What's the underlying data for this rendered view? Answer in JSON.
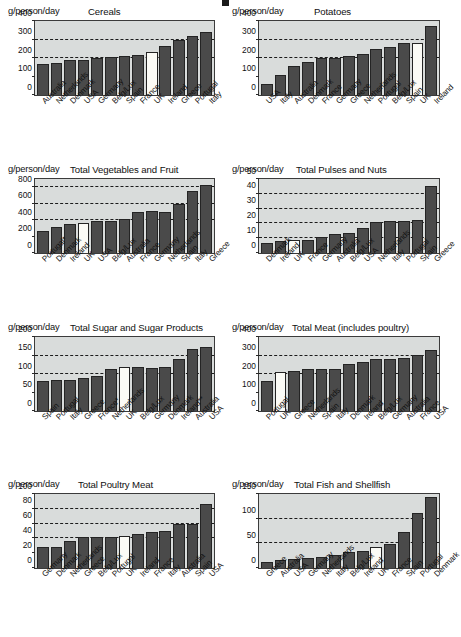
{
  "figure": {
    "yaxis_unit_label": "g/person/day",
    "highlight_country": "UK",
    "highlight_note": "UK bar drawn in white/unfilled"
  },
  "chart_data": [
    {
      "id": "cereals",
      "type": "bar",
      "title": "Cereals",
      "ylabel": "g/person/day",
      "xlabel": "",
      "ylim": [
        0,
        400
      ],
      "yticks": [
        0,
        100,
        200,
        300,
        400
      ],
      "gridlines": [
        200,
        300
      ],
      "grid": true,
      "highlight": "UK",
      "categories": [
        "Australia",
        "Netherlands",
        "Denmark",
        "USA",
        "Germany",
        "Belg/Lux",
        "Spain",
        "France",
        "UK",
        "Ireland",
        "Greece",
        "Portugal",
        "Italy"
      ],
      "values": [
        165,
        172,
        190,
        190,
        202,
        206,
        213,
        219,
        231,
        265,
        300,
        320,
        340
      ]
    },
    {
      "id": "potatoes",
      "type": "bar",
      "title": "Potatoes",
      "ylabel": "g/person/day",
      "xlabel": "",
      "ylim": [
        0,
        400
      ],
      "yticks": [
        0,
        100,
        200,
        300,
        400
      ],
      "gridlines": [
        200,
        300
      ],
      "grid": true,
      "highlight": "UK",
      "categories": [
        "USA",
        "Italy",
        "Australia",
        "Denmark",
        "France",
        "Germany",
        "Greece",
        "Netherlands",
        "Portugal",
        "Belg/Lux",
        "Spain",
        "UK",
        "Ireland"
      ],
      "values": [
        60,
        110,
        157,
        176,
        199,
        199,
        212,
        224,
        247,
        260,
        279,
        280,
        372
      ]
    },
    {
      "id": "vegetables-fruit",
      "type": "bar",
      "title": "Total Vegetables and Fruit",
      "ylabel": "g/person/day",
      "xlabel": "",
      "ylim": [
        0,
        900
      ],
      "yticks": [
        0,
        200,
        400,
        600,
        800
      ],
      "gridlines": [
        400,
        600,
        800
      ],
      "grid": true,
      "highlight": "UK",
      "categories": [
        "Portugal*",
        "Denmark",
        "Ireland",
        "UK",
        "USA",
        "Belg/Lux",
        "Australia",
        "France",
        "Germany",
        "Netherlands",
        "Spain",
        "Italy",
        "Greece"
      ],
      "values": [
        272,
        311,
        352,
        363,
        386,
        389,
        419,
        497,
        512,
        503,
        598,
        755,
        825
      ]
    },
    {
      "id": "pulses-nuts",
      "type": "bar",
      "title": "Total Pulses and Nuts",
      "ylabel": "g/person/day",
      "xlabel": "",
      "ylim": [
        0,
        50
      ],
      "yticks": [
        0,
        10,
        20,
        30,
        40,
        50
      ],
      "gridlines": [
        10,
        20,
        30,
        40
      ],
      "grid": true,
      "highlight": "UK",
      "categories": [
        "Denmark",
        "Ireland",
        "UK",
        "France",
        "Germany",
        "Australia",
        "Belg/Lux",
        "USA",
        "Netherlands",
        "Italy",
        "Portugal",
        "Spain",
        "Greece"
      ],
      "values": [
        6.8,
        8.4,
        8.6,
        9.0,
        10.8,
        13.1,
        13.7,
        17.2,
        20.7,
        21.4,
        21.6,
        22.6,
        45.6
      ]
    },
    {
      "id": "sugar",
      "type": "bar",
      "title": "Total Sugar and Sugar Products",
      "ylabel": "g/person/day",
      "xlabel": "",
      "ylim": [
        0,
        200
      ],
      "yticks": [
        0,
        50,
        100,
        150,
        200
      ],
      "gridlines": [
        100,
        150
      ],
      "grid": true,
      "highlight": "UK",
      "categories": [
        "Spain",
        "Portugal",
        "Italy",
        "Greece",
        "France*",
        "Netherlands",
        "UK",
        "Belg/Lux",
        "Germany",
        "Denmark",
        "Ireland**",
        "Australia",
        "USA"
      ],
      "values": [
        82,
        83,
        84,
        88,
        95,
        114,
        118,
        118,
        116,
        120,
        140,
        167,
        174
      ]
    },
    {
      "id": "meat",
      "type": "bar",
      "title": "Total Meat (includes poultry)",
      "ylabel": "g/person/day",
      "xlabel": "",
      "ylim": [
        0,
        400
      ],
      "yticks": [
        0,
        100,
        200,
        300,
        400
      ],
      "gridlines": [
        200,
        300
      ],
      "grid": true,
      "highlight": "UK",
      "categories": [
        "Portugal",
        "UK",
        "Greece",
        "Netherlands",
        "Spain",
        "Italy",
        "Denmark",
        "Ireland",
        "Belg/Lux",
        "Germany",
        "Australia",
        "France",
        "USA"
      ],
      "values": [
        164,
        212,
        218,
        228,
        229,
        228,
        254,
        266,
        280,
        283,
        285,
        305,
        328
      ]
    },
    {
      "id": "poultry",
      "type": "bar",
      "title": "Total Poultry Meat",
      "ylabel": "g/person/day",
      "xlabel": "",
      "ylim": [
        0,
        100
      ],
      "yticks": [
        0,
        20,
        40,
        60,
        80,
        100
      ],
      "gridlines": [
        40,
        60,
        80
      ],
      "grid": true,
      "highlight": "UK",
      "categories": [
        "Germany",
        "Denmark",
        "Netherlands",
        "Greece",
        "Belg/Lux",
        "Portugal",
        "UK",
        "Ireland",
        "France",
        "Italy",
        "Australia",
        "Spain",
        "USA"
      ],
      "values": [
        28.5,
        29,
        36,
        41.5,
        42,
        42.5,
        43.5,
        46,
        49,
        50.5,
        59.5,
        60,
        86
      ]
    },
    {
      "id": "fish-shellfish",
      "type": "bar",
      "title": "Total Fish and Shellfish",
      "ylabel": "g/person/day",
      "xlabel": "",
      "ylim": [
        0,
        150
      ],
      "yticks": [
        0,
        50,
        100,
        150
      ],
      "gridlines": [
        50,
        100
      ],
      "grid": true,
      "highlight": "UK",
      "categories": [
        "Greece",
        "Australia",
        "USA",
        "Germany",
        "Netherlands",
        "Italy",
        "Belg/Lux",
        "Ireland",
        "UK",
        "France",
        "Spain",
        "Portugal",
        "Denmark"
      ],
      "values": [
        13,
        16,
        19,
        21,
        23,
        27,
        32,
        34,
        42,
        49,
        74,
        111,
        144
      ]
    }
  ]
}
